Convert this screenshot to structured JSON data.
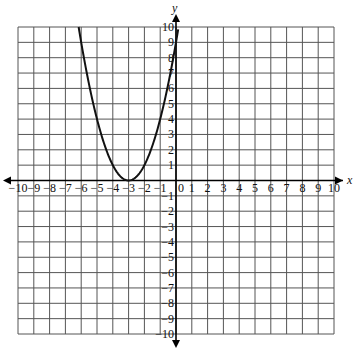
{
  "chart_data": {
    "type": "line",
    "title": "",
    "xlabel": "x",
    "ylabel": "y",
    "xlim": [
      -10,
      10
    ],
    "ylim": [
      -10,
      10
    ],
    "grid": true,
    "x_ticks": [
      -10,
      -9,
      -8,
      -7,
      -6,
      -5,
      -4,
      -3,
      -2,
      -1,
      0,
      1,
      2,
      3,
      4,
      5,
      6,
      7,
      8,
      9,
      10
    ],
    "y_ticks": [
      -10,
      -9,
      -8,
      -7,
      -6,
      -5,
      -4,
      -3,
      -2,
      -1,
      1,
      2,
      3,
      4,
      5,
      6,
      7,
      8,
      9,
      10
    ],
    "origin_label": "0",
    "series": [
      {
        "name": "parabola",
        "equation": "y = (x + 3)^2",
        "vertex": [
          -3,
          0
        ],
        "x": [
          -6.16,
          -6,
          -5,
          -4,
          -3,
          -2,
          -1,
          0,
          0.16
        ],
        "y": [
          10,
          9,
          4,
          1,
          0,
          1,
          4,
          9,
          10
        ]
      }
    ]
  },
  "colors": {
    "grid": "#555555",
    "axis": "#000000",
    "curve": "#111111"
  }
}
